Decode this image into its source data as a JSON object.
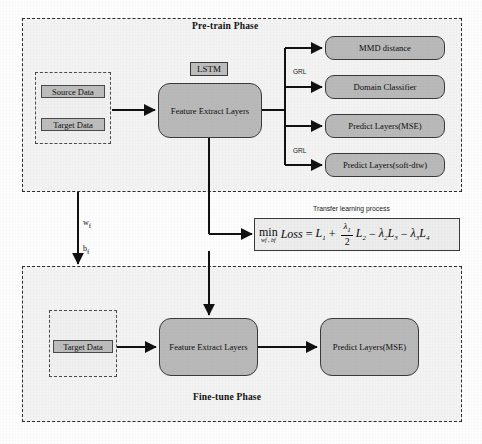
{
  "figure": {
    "type": "flow-diagram"
  },
  "pretrain": {
    "title": "Pre-train Phase",
    "inputs": [
      {
        "label": "Source Data"
      },
      {
        "label": "Target Data"
      }
    ],
    "lstm_label": "LSTM",
    "feature_extractor": "Feature Extract Layers",
    "heads": [
      {
        "label": "MMD distance",
        "gate": ""
      },
      {
        "label": "Domain  Classifier",
        "gate": "GRL"
      },
      {
        "label": "Predict Layers(MSE)",
        "gate": ""
      },
      {
        "label": "Predict Layers(soft-dtw)",
        "gate": "GRL"
      }
    ],
    "gate_labels": {
      "top": "GRL",
      "bottom": "GRL"
    }
  },
  "transfer": {
    "caption": "Transfer learning process",
    "formula_plain": "min_{w_f,b_f} Loss = L1 + (λ1/2) L2 - λ2 L3 - λ3 L4",
    "parts": {
      "min": "min",
      "min_sub": "wf , bf",
      "loss": "Loss",
      "equals": "=",
      "t1": "L",
      "t1_sub": "1",
      "plus": "+",
      "frac_num": "λ",
      "frac_num_sub": "1",
      "frac_den": "2",
      "t2": "L",
      "t2_sub": "2",
      "minus1": "−",
      "l2coef": "λ",
      "l2coef_sub": "2",
      "t3": "L",
      "t3_sub": "3",
      "minus2": "−",
      "l3coef": "λ",
      "l3coef_sub": "3",
      "t4": "L",
      "t4_sub": "4"
    }
  },
  "weights_transfer": {
    "w_label": "w",
    "w_sub": "f",
    "b_label": "b",
    "b_sub": "f"
  },
  "finetune": {
    "title": "Fine-tune Phase",
    "input": {
      "label": "Target Data"
    },
    "feature_extractor": "Feature Extract Layers",
    "predictor": "Predict Layers(MSE)"
  },
  "colors": {
    "box_fill": "#b9b9b9",
    "chip_fill": "#bdbdbd",
    "panel_fill": "#f3f3f3",
    "stroke": "#2b2b2b",
    "page_bg": "#fdfdfd"
  }
}
